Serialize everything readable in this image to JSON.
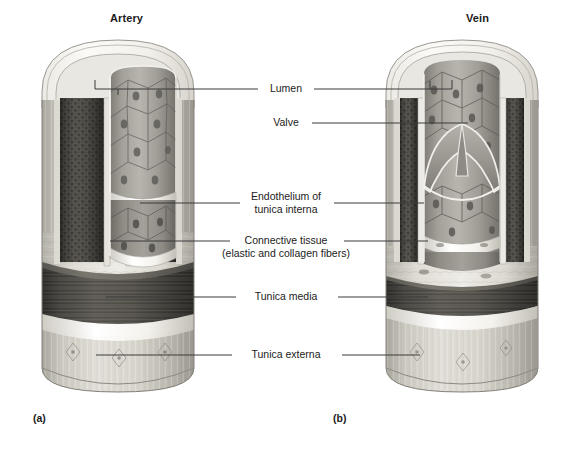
{
  "figure": {
    "panels": [
      {
        "id": "a",
        "title": "Artery",
        "sublabel": "(a)"
      },
      {
        "id": "b",
        "title": "Vein",
        "sublabel": "(b)"
      }
    ],
    "labels": [
      {
        "id": "lumen",
        "text": "Lumen",
        "text2": ""
      },
      {
        "id": "valve",
        "text": "Valve",
        "text2": ""
      },
      {
        "id": "endo",
        "text": "Endothelium of",
        "text2": "tunica interna"
      },
      {
        "id": "conn",
        "text": "Connective tissue",
        "text2": "(elastic and collagen fibers)"
      },
      {
        "id": "tmedia",
        "text": "Tunica media",
        "text2": ""
      },
      {
        "id": "texterna",
        "text": "Tunica externa",
        "text2": ""
      }
    ],
    "colors": {
      "background": "#ffffff",
      "leader_line": "#3a3a3a",
      "text": "#1b1b1b",
      "tunica_media_dark": "#4a4845",
      "tunica_media_deep": "#3b3936",
      "connective_light": "#d8d5ce",
      "externa_light": "#cfccc4",
      "endothelium_mid": "#9c9a94",
      "lumen_cell": "#a8a6a0",
      "outline": "#6b6862"
    }
  }
}
